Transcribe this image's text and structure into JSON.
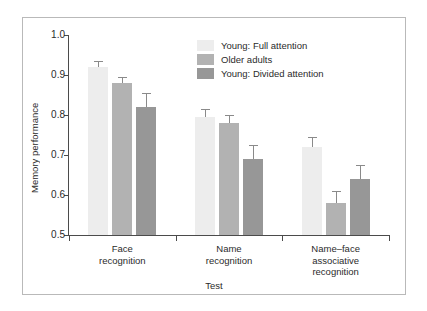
{
  "chart_data": {
    "type": "bar",
    "title": "",
    "xlabel": "Test",
    "ylabel": "Memory performance",
    "ylim": [
      0.5,
      1.0
    ],
    "yticks": [
      "1.0",
      "0.9",
      "0.8",
      "0.7",
      "0.6",
      "0.5"
    ],
    "ytick_values": [
      1.0,
      0.9,
      0.8,
      0.7,
      0.6,
      0.5
    ],
    "grid": false,
    "legend_position": "top-center-right",
    "categories": [
      "Face\nrecognition",
      "Name\nrecognition",
      "Name–face\nassociative\nrecognition"
    ],
    "category_lines": [
      [
        "Face",
        "recognition"
      ],
      [
        "Name",
        "recognition"
      ],
      [
        "Name–face",
        "associative",
        "recognition"
      ]
    ],
    "series": [
      {
        "name": "Young: Full attention",
        "color": "#ededed",
        "values": [
          0.92,
          0.795,
          0.72
        ],
        "errors_upper": [
          0.935,
          0.815,
          0.745
        ]
      },
      {
        "name": "Older adults",
        "color": "#b2b2b2",
        "values": [
          0.88,
          0.78,
          0.58
        ],
        "errors_upper": [
          0.895,
          0.8,
          0.61
        ]
      },
      {
        "name": "Young: Divided attention",
        "color": "#979797",
        "values": [
          0.82,
          0.69,
          0.64
        ],
        "errors_upper": [
          0.855,
          0.725,
          0.675
        ]
      }
    ]
  }
}
